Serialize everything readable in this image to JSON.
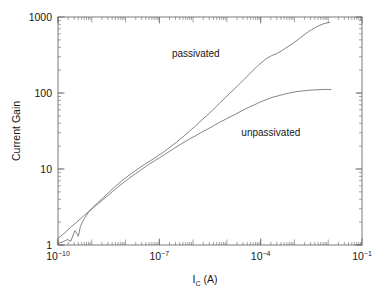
{
  "chart_data": {
    "type": "line",
    "title": "",
    "subtitle": "",
    "xlabel": "I_C (A)",
    "xlabel_base": "I",
    "xlabel_sub": "C",
    "xlabel_unit": " (A)",
    "ylabel": "Current Gain",
    "xscale": "log",
    "yscale": "log",
    "xlim": [
      1e-10,
      0.1
    ],
    "ylim": [
      1,
      1000
    ],
    "grid": false,
    "legend_position": "inline-annotations",
    "x_major_ticks": [
      {
        "value": 1e-10,
        "label": "10",
        "exponent": "−10"
      },
      {
        "value": 1e-07,
        "label": "10",
        "exponent": "−7"
      },
      {
        "value": 0.0001,
        "label": "10",
        "exponent": "−4"
      },
      {
        "value": 0.1,
        "label": "10",
        "exponent": "−1"
      }
    ],
    "x_decade_edges": [
      1e-10,
      1e-09,
      1e-08,
      1e-07,
      1e-06,
      1e-05,
      0.0001,
      0.001,
      0.01,
      0.1
    ],
    "y_major_ticks": [
      {
        "value": 1,
        "label": "1"
      },
      {
        "value": 10,
        "label": "10"
      },
      {
        "value": 100,
        "label": "100"
      },
      {
        "value": 1000,
        "label": "1000"
      }
    ],
    "annotations": [
      {
        "text": "passivated",
        "x": 1.2e-06,
        "y": 300
      },
      {
        "text": "unpassivated",
        "x": 0.0002,
        "y": 27
      }
    ],
    "series": [
      {
        "name": "passivated",
        "color": "#6e6e6e",
        "points": [
          [
            1e-10,
            1.05
          ],
          [
            1.4e-10,
            1.1
          ],
          [
            1.9e-10,
            1.18
          ],
          [
            2.4e-10,
            1.12
          ],
          [
            2.8e-10,
            1.35
          ],
          [
            3.2e-10,
            1.55
          ],
          [
            3.6e-10,
            1.42
          ],
          [
            4e-10,
            1.3
          ],
          [
            4.6e-10,
            1.75
          ],
          [
            5.4e-10,
            2.05
          ],
          [
            6.5e-10,
            2.35
          ],
          [
            8e-10,
            2.7
          ],
          [
            1e-09,
            3.0
          ],
          [
            1.5e-09,
            3.6
          ],
          [
            2.2e-09,
            4.2
          ],
          [
            3.3e-09,
            5.0
          ],
          [
            5e-09,
            5.9
          ],
          [
            7.5e-09,
            6.9
          ],
          [
            1.1e-08,
            7.9
          ],
          [
            1.7e-08,
            9.1
          ],
          [
            2.6e-08,
            10.4
          ],
          [
            4e-08,
            11.8
          ],
          [
            6e-08,
            13.2
          ],
          [
            9e-08,
            14.9
          ],
          [
            1.4e-07,
            17.0
          ],
          [
            2.1e-07,
            19.5
          ],
          [
            3.2e-07,
            22.5
          ],
          [
            5e-07,
            26.5
          ],
          [
            7.5e-07,
            31.0
          ],
          [
            1.1e-06,
            36.0
          ],
          [
            1.7e-06,
            43.0
          ],
          [
            2.6e-06,
            51.0
          ],
          [
            4e-06,
            61.0
          ],
          [
            6e-06,
            73.0
          ],
          [
            9e-06,
            87.0
          ],
          [
            1.4e-05,
            105
          ],
          [
            2.1e-05,
            125
          ],
          [
            3.2e-05,
            150
          ],
          [
            4.5e-05,
            175
          ],
          [
            6e-05,
            200
          ],
          [
            8e-05,
            225
          ],
          [
            0.00011,
            255
          ],
          [
            0.00015,
            285
          ],
          [
            0.00021,
            310
          ],
          [
            0.0003,
            330
          ],
          [
            0.00042,
            360
          ],
          [
            0.0006,
            400
          ],
          [
            0.0009,
            450
          ],
          [
            0.0014,
            520
          ],
          [
            0.0021,
            600
          ],
          [
            0.0032,
            680
          ],
          [
            0.005,
            760
          ],
          [
            0.0075,
            820
          ],
          [
            0.011,
            850
          ]
        ]
      },
      {
        "name": "unpassivated",
        "color": "#6e6e6e",
        "points": [
          [
            1e-10,
            1.22
          ],
          [
            1.6e-10,
            1.45
          ],
          [
            2.4e-10,
            1.72
          ],
          [
            3.6e-10,
            2.0
          ],
          [
            5.4e-10,
            2.35
          ],
          [
            8e-10,
            2.75
          ],
          [
            1.2e-09,
            3.2
          ],
          [
            1.8e-09,
            3.7
          ],
          [
            2.7e-09,
            4.3
          ],
          [
            4e-09,
            5.0
          ],
          [
            6e-09,
            5.8
          ],
          [
            9e-09,
            6.7
          ],
          [
            1.3e-08,
            7.6
          ],
          [
            2e-08,
            8.7
          ],
          [
            3e-08,
            9.9
          ],
          [
            4.5e-08,
            11.2
          ],
          [
            7e-08,
            12.7
          ],
          [
            1e-07,
            14.0
          ],
          [
            1.6e-07,
            16.0
          ],
          [
            2.4e-07,
            18.0
          ],
          [
            3.6e-07,
            20.2
          ],
          [
            5.4e-07,
            22.5
          ],
          [
            8e-07,
            25.0
          ],
          [
            1.2e-06,
            27.5
          ],
          [
            1.8e-06,
            30.5
          ],
          [
            2.7e-06,
            33.5
          ],
          [
            4e-06,
            37.0
          ],
          [
            6e-06,
            41.0
          ],
          [
            9e-06,
            45.0
          ],
          [
            1.3e-05,
            49.0
          ],
          [
            2e-05,
            54.0
          ],
          [
            3e-05,
            59.5
          ],
          [
            4.5e-05,
            65.0
          ],
          [
            7e-05,
            71.0
          ],
          [
            0.0001,
            76.5
          ],
          [
            0.00015,
            82.0
          ],
          [
            0.00022,
            87.5
          ],
          [
            0.00033,
            92.0
          ],
          [
            0.0005,
            96.5
          ],
          [
            0.00075,
            100.5
          ],
          [
            0.0011,
            104
          ],
          [
            0.0017,
            106.5
          ],
          [
            0.0026,
            108.5
          ],
          [
            0.004,
            110
          ],
          [
            0.006,
            111
          ],
          [
            0.009,
            111.5
          ],
          [
            0.012,
            111
          ]
        ]
      }
    ]
  },
  "plot": {
    "frame": {
      "left": 58,
      "right": 362,
      "top": 17,
      "bottom": 245
    }
  }
}
